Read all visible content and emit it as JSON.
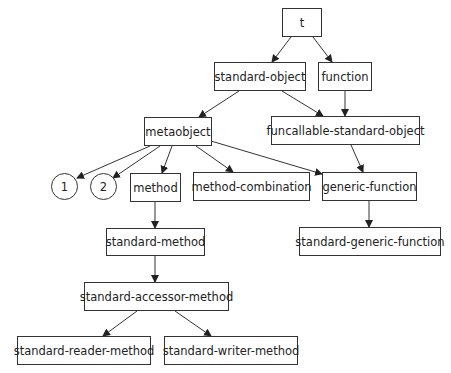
{
  "diagram": {
    "type": "class-hierarchy",
    "nodes": [
      {
        "id": "t",
        "label": "t",
        "shape": "box",
        "x": 282,
        "y": 8,
        "w": 40,
        "h": 29
      },
      {
        "id": "standard-object",
        "label": "standard-object",
        "shape": "box",
        "x": 214,
        "y": 62,
        "w": 92,
        "h": 29
      },
      {
        "id": "function",
        "label": "function",
        "shape": "box",
        "x": 318,
        "y": 62,
        "w": 54,
        "h": 29
      },
      {
        "id": "metaobject",
        "label": "metaobject",
        "shape": "box",
        "x": 144,
        "y": 117,
        "w": 68,
        "h": 29
      },
      {
        "id": "funcallable-standard-object",
        "label": "funcallable-standard-object",
        "shape": "box",
        "x": 271,
        "y": 116,
        "w": 149,
        "h": 29
      },
      {
        "id": "c1",
        "label": "1",
        "shape": "circle",
        "x": 51,
        "y": 173,
        "w": 27,
        "h": 27
      },
      {
        "id": "c2",
        "label": "2",
        "shape": "circle",
        "x": 90,
        "y": 173,
        "w": 27,
        "h": 27
      },
      {
        "id": "method",
        "label": "method",
        "shape": "box",
        "x": 130,
        "y": 173,
        "w": 51,
        "h": 29
      },
      {
        "id": "method-combination",
        "label": "method-combination",
        "shape": "box",
        "x": 193,
        "y": 172,
        "w": 117,
        "h": 29
      },
      {
        "id": "generic-function",
        "label": "generic-function",
        "shape": "box",
        "x": 322,
        "y": 172,
        "w": 95,
        "h": 29
      },
      {
        "id": "standard-method",
        "label": "standard-method",
        "shape": "box",
        "x": 106,
        "y": 228,
        "w": 99,
        "h": 28
      },
      {
        "id": "standard-generic-function",
        "label": "standard-generic-function",
        "shape": "box",
        "x": 299,
        "y": 227,
        "w": 142,
        "h": 29
      },
      {
        "id": "standard-accessor-method",
        "label": "standard-accessor-method",
        "shape": "box",
        "x": 84,
        "y": 282,
        "w": 145,
        "h": 29
      },
      {
        "id": "standard-reader-method",
        "label": "standard-reader-method",
        "shape": "box",
        "x": 17,
        "y": 336,
        "w": 134,
        "h": 29
      },
      {
        "id": "standard-writer-method",
        "label": "standard-writer-method",
        "shape": "box",
        "x": 164,
        "y": 336,
        "w": 134,
        "h": 29
      }
    ],
    "edges": [
      {
        "from": "t",
        "to": "standard-object",
        "x1": 291,
        "y1": 37,
        "x2": 272,
        "y2": 62
      },
      {
        "from": "t",
        "to": "function",
        "x1": 313,
        "y1": 37,
        "x2": 332,
        "y2": 62
      },
      {
        "from": "standard-object",
        "to": "metaobject",
        "x1": 239,
        "y1": 91,
        "x2": 199,
        "y2": 117
      },
      {
        "from": "standard-object",
        "to": "funcallable-standard-object",
        "x1": 282,
        "y1": 91,
        "x2": 323,
        "y2": 116
      },
      {
        "from": "function",
        "to": "funcallable-standard-object",
        "x1": 345,
        "y1": 91,
        "x2": 345,
        "y2": 116
      },
      {
        "from": "metaobject",
        "to": "c1",
        "x1": 150,
        "y1": 146,
        "x2": 77,
        "y2": 178
      },
      {
        "from": "metaobject",
        "to": "c2",
        "x1": 160,
        "y1": 146,
        "x2": 113,
        "y2": 178
      },
      {
        "from": "metaobject",
        "to": "method",
        "x1": 172,
        "y1": 146,
        "x2": 162,
        "y2": 173
      },
      {
        "from": "metaobject",
        "to": "method-combination",
        "x1": 196,
        "y1": 146,
        "x2": 233,
        "y2": 172
      },
      {
        "from": "metaobject",
        "to": "generic-function",
        "x1": 211,
        "y1": 141,
        "x2": 322,
        "y2": 174
      },
      {
        "from": "funcallable-standard-object",
        "to": "generic-function",
        "x1": 351,
        "y1": 145,
        "x2": 363,
        "y2": 172
      },
      {
        "from": "method",
        "to": "standard-method",
        "x1": 155,
        "y1": 202,
        "x2": 155,
        "y2": 228
      },
      {
        "from": "generic-function",
        "to": "standard-generic-function",
        "x1": 369,
        "y1": 201,
        "x2": 369,
        "y2": 227
      },
      {
        "from": "standard-method",
        "to": "standard-accessor-method",
        "x1": 155,
        "y1": 256,
        "x2": 155,
        "y2": 282
      },
      {
        "from": "standard-accessor-method",
        "to": "standard-reader-method",
        "x1": 137,
        "y1": 311,
        "x2": 103,
        "y2": 336
      },
      {
        "from": "standard-accessor-method",
        "to": "standard-writer-method",
        "x1": 175,
        "y1": 311,
        "x2": 211,
        "y2": 336
      }
    ]
  }
}
